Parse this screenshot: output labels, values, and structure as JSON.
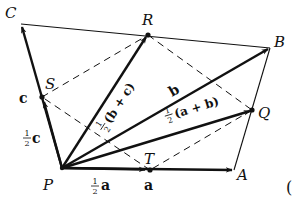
{
  "figure": {
    "colors": {
      "ink": "#111111",
      "background": "#ffffff"
    },
    "points": {
      "P": {
        "label": "P",
        "x": 62,
        "y": 168
      },
      "A": {
        "label": "A",
        "x": 234,
        "y": 170
      },
      "B": {
        "label": "B",
        "x": 270,
        "y": 48
      },
      "C": {
        "label": "C",
        "x": 21,
        "y": 24
      },
      "Q": {
        "label": "Q",
        "x": 252,
        "y": 110
      },
      "R": {
        "label": "R",
        "x": 148,
        "y": 35
      },
      "S": {
        "label": "S",
        "x": 42,
        "y": 97
      },
      "T": {
        "label": "T",
        "x": 150,
        "y": 170
      }
    },
    "vector_labels": {
      "a": "a",
      "half_a_num": "1",
      "half_a_den": "2",
      "half_a_vec": "a",
      "b": "b",
      "c": "c",
      "half_c_num": "1",
      "half_c_den": "2",
      "half_c_vec": "c",
      "half_ab_num": "1",
      "half_ab_den": "2",
      "half_ab_expr": "(a + b)",
      "half_bc_num": "1",
      "half_bc_den": "2",
      "half_bc_expr": "(b + c)"
    },
    "edge_fragment": "("
  }
}
